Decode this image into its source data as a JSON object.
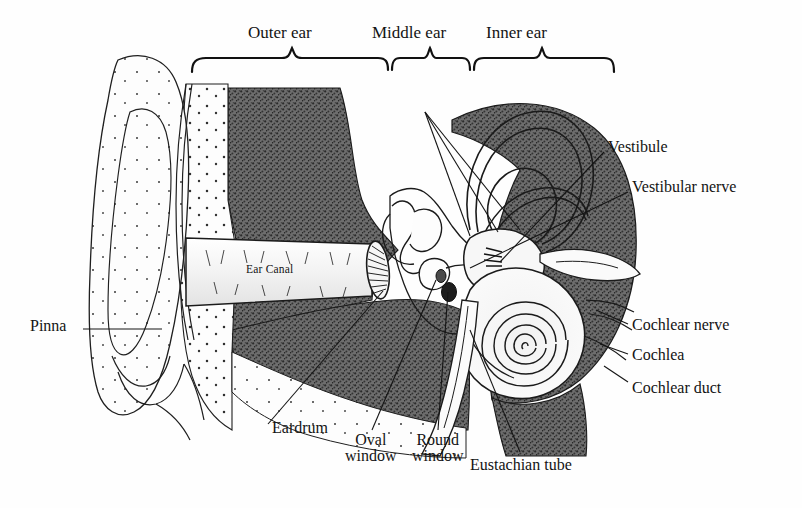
{
  "figure": {
    "ink_color": "#131313",
    "bone_fill": "#6f6f6f",
    "light_fill": "#fbfbfb",
    "background": "#ffffff"
  },
  "regions": [
    {
      "label": "Outer ear",
      "brace_x1": 192,
      "brace_x2": 388,
      "text_x": 248,
      "text_y": 24
    },
    {
      "label": "Middle ear",
      "brace_x1": 390,
      "brace_x2": 470,
      "text_x": 372,
      "text_y": 24
    },
    {
      "label": "Inner ear",
      "brace_x1": 472,
      "brace_x2": 614,
      "text_x": 486,
      "text_y": 24
    }
  ],
  "callouts": [
    {
      "name": "pinna",
      "text": "Pinna",
      "text_x": 30,
      "text_y": 318,
      "lines": [
        [
          83,
          329,
          162,
          329
        ]
      ]
    },
    {
      "name": "vestibule",
      "text": "Vestibule",
      "text_x": 608,
      "text_y": 139,
      "lines": [
        [
          604,
          152,
          500,
          262
        ]
      ]
    },
    {
      "name": "vestibular-nerve",
      "text": "Vestibular nerve",
      "text_x": 632,
      "text_y": 179,
      "lines": [
        [
          628,
          192,
          470,
          268
        ]
      ]
    },
    {
      "name": "cochlear-nerve",
      "text": "Cochlear nerve",
      "text_x": 632,
      "text_y": 317,
      "lines": [
        [
          628,
          324,
          596,
          310
        ]
      ]
    },
    {
      "name": "cochlea",
      "text": "Cochlea",
      "text_x": 632,
      "text_y": 347,
      "lines": [
        [
          628,
          354,
          600,
          344
        ]
      ]
    },
    {
      "name": "cochlear-duct",
      "text": "Cochlear duct",
      "text_x": 632,
      "text_y": 380,
      "lines": [
        [
          628,
          382,
          604,
          366
        ]
      ]
    },
    {
      "name": "eardrum",
      "text": "Eardrum",
      "text_x": 272,
      "text_y": 420,
      "lines": [
        [
          268,
          424,
          383,
          291
        ]
      ]
    },
    {
      "name": "eustachian-tube",
      "text": "Eustachian tube",
      "text_x": 470,
      "text_y": 457,
      "lines": [
        [
          520,
          452,
          470,
          330
        ]
      ]
    }
  ],
  "stacked_callouts": [
    {
      "name": "oval-window",
      "line1": "Oval",
      "line2": "window",
      "text_x": 345,
      "text_y": 432,
      "lines": [
        [
          372,
          430,
          436,
          280
        ]
      ]
    },
    {
      "name": "round-window",
      "line1": "Round",
      "line2": "window",
      "text_x": 412,
      "text_y": 432,
      "lines": [
        [
          438,
          430,
          448,
          292
        ]
      ]
    }
  ],
  "inline_labels": [
    {
      "name": "ear-canal",
      "text": "Ear Canal",
      "text_x": 246,
      "text_y": 264
    }
  ],
  "structures": [
    "pinna",
    "ear-canal",
    "eardrum",
    "ossicles",
    "semicircular-canals",
    "vestibule",
    "cochlea",
    "cochlear-spiral",
    "round-window",
    "oval-window",
    "eustachian-tube",
    "temporal-bone",
    "vestibular-nerve",
    "cochlear-nerve"
  ]
}
